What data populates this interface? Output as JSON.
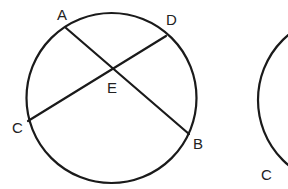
{
  "figures": [
    {
      "name": "circle-left",
      "circle": {
        "cx": 111.5,
        "cy": 98,
        "r": 85
      },
      "chords": [
        {
          "name": "chord-AB",
          "from": "A",
          "to": "B"
        },
        {
          "name": "chord-CD",
          "from": "C",
          "to": "D"
        }
      ],
      "points": {
        "A": {
          "x": 66,
          "y": 28,
          "label": "A",
          "lx": 57,
          "ly": 20
        },
        "B": {
          "x": 189,
          "y": 134,
          "label": "B",
          "lx": 193,
          "ly": 149
        },
        "C": {
          "x": 28,
          "y": 121,
          "label": "C",
          "lx": 12,
          "ly": 133
        },
        "D": {
          "x": 166,
          "y": 36,
          "label": "D",
          "lx": 166,
          "ly": 25
        },
        "E": {
          "x": 114,
          "y": 69,
          "label": "E",
          "lx": 107,
          "ly": 93
        }
      }
    },
    {
      "name": "circle-right-partial",
      "circle": {
        "cx": 343,
        "cy": 100,
        "r": 85
      },
      "points": {
        "C": {
          "label": "C",
          "lx": 261,
          "ly": 180
        }
      }
    }
  ],
  "labels": {
    "A": "A",
    "B": "B",
    "C": "C",
    "D": "D",
    "E": "E",
    "C2": "C"
  },
  "colors": {
    "stroke": "#1a1a1a",
    "text": "#222222",
    "background": "#ffffff"
  }
}
